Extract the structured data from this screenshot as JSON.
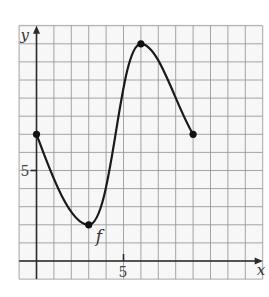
{
  "chart_data": {
    "type": "line",
    "title": "",
    "xlabel": "x",
    "ylabel": "y",
    "function_label": "f",
    "xlim": [
      -1,
      13
    ],
    "ylim": [
      -1,
      13
    ],
    "grid": true,
    "x_tick_labels": [
      {
        "value": 5,
        "label": "5"
      }
    ],
    "y_tick_labels": [
      {
        "value": 5,
        "label": "5"
      }
    ],
    "series": [
      {
        "name": "f",
        "marked_points": [
          {
            "x": 0,
            "y": 7
          },
          {
            "x": 3,
            "y": 2
          },
          {
            "x": 6,
            "y": 12
          },
          {
            "x": 9,
            "y": 7
          }
        ],
        "description": "Decreases from (0,7) to local min (3,2), increases to local max (6,12), decreases to (9,7)"
      }
    ]
  },
  "labels": {
    "x_axis": "x",
    "y_axis": "y",
    "x_tick": "5",
    "y_tick": "5",
    "curve": "f"
  }
}
